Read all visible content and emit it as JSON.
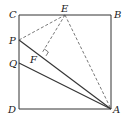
{
  "figure": {
    "type": "geometry",
    "shape": "square ABCD with points E on CB, P and Q on CD, F foot of perpendicular from E to AP",
    "points": {
      "A": {
        "label": "A",
        "x": 111,
        "y": 109
      },
      "B": {
        "label": "B",
        "x": 111,
        "y": 15
      },
      "C": {
        "label": "C",
        "x": 19,
        "y": 15
      },
      "D": {
        "label": "D",
        "x": 19,
        "y": 109
      },
      "E": {
        "label": "E",
        "x": 65,
        "y": 15
      },
      "P": {
        "label": "P",
        "x": 19,
        "y": 40
      },
      "Q": {
        "label": "Q",
        "x": 19,
        "y": 63
      },
      "F": {
        "label": "F",
        "x": 42,
        "y": 53
      }
    },
    "solid_segments": [
      "CB",
      "BA",
      "AD",
      "DC",
      "AP",
      "AQ"
    ],
    "dashed_segments": [
      "PE",
      "EF",
      "EA"
    ],
    "right_angle_at": "F",
    "line_color": "#333333"
  }
}
